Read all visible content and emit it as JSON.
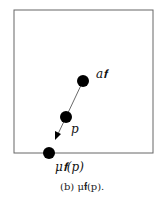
{
  "figure": {
    "caption": "(b) μ𝐟(p).",
    "labels": {
      "a_f": "a𝐟",
      "p": "p",
      "mu_f_p": "μ𝐟(p)"
    },
    "colors": {
      "stroke": "#555555",
      "point": "#000000",
      "background": "#ffffff"
    },
    "points": [
      {
        "name": "a_f",
        "x": 83,
        "y": 81
      },
      {
        "name": "p",
        "x": 66,
        "y": 117
      },
      {
        "name": "mu_f_p",
        "x": 49,
        "y": 153
      }
    ]
  }
}
